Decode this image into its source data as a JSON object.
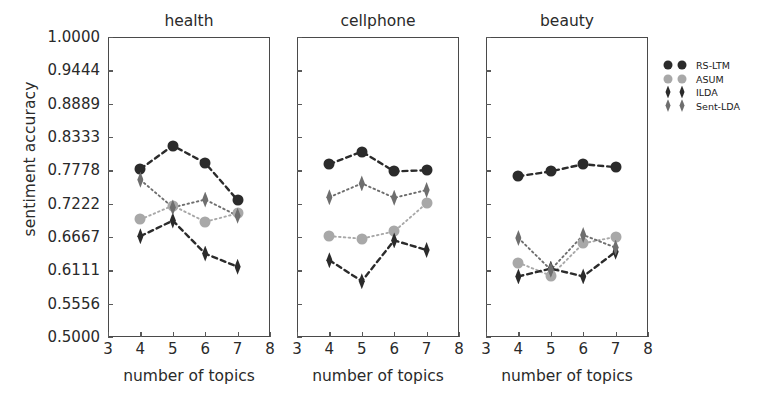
{
  "figure": {
    "ylabel": "sentiment accuracy",
    "xlabel": "number of topics",
    "yticks": [
      "1.0000",
      "0.9444",
      "0.8889",
      "0.8333",
      "0.7778",
      "0.7222",
      "0.6667",
      "0.6111",
      "0.5556",
      "0.5000"
    ],
    "ytickvals": [
      1.0,
      0.9444,
      0.8889,
      0.8333,
      0.7778,
      0.7222,
      0.6667,
      0.6111,
      0.5556,
      0.5
    ],
    "xticks": [
      "3",
      "4",
      "5",
      "6",
      "7",
      "8"
    ],
    "xtickvals": [
      3,
      4,
      5,
      6,
      7,
      8
    ]
  },
  "colors": {
    "dark": "#2b2b2b",
    "light": "#a8a8a8",
    "medium": "#6e6e6e",
    "axis": "#4a4a4a",
    "text": "#2a2a2a"
  },
  "legend": {
    "entries": [
      {
        "label": "RS-LTM",
        "marker": "circle",
        "shade": "dark",
        "linestyle": "dashed"
      },
      {
        "label": "ASUM",
        "marker": "circle",
        "shade": "light",
        "linestyle": "dotted"
      },
      {
        "label": "ILDA",
        "marker": "diamond",
        "shade": "dark",
        "linestyle": "dashed"
      },
      {
        "label": "Sent-LDA",
        "marker": "diamond",
        "shade": "medium",
        "linestyle": "dotted"
      }
    ]
  },
  "chart_data": {
    "type": "line",
    "title": "",
    "xlabel": "number of topics",
    "ylabel": "sentiment accuracy",
    "xlim": [
      3,
      8
    ],
    "ylim": [
      0.5,
      1.0
    ],
    "grid": false,
    "legend_position": "right",
    "x": [
      4,
      5,
      6,
      7
    ],
    "panels": [
      {
        "title": "health",
        "series": [
          {
            "name": "RS-LTM",
            "values": [
              0.78,
              0.819,
              0.79,
              0.728
            ]
          },
          {
            "name": "ASUM",
            "values": [
              0.696,
              0.719,
              0.692,
              0.706
            ]
          },
          {
            "name": "ILDA",
            "values": [
              0.668,
              0.694,
              0.639,
              0.617
            ]
          },
          {
            "name": "Sent-LDA",
            "values": [
              0.762,
              0.716,
              0.729,
              0.702
            ]
          }
        ]
      },
      {
        "title": "cellphone",
        "series": [
          {
            "name": "RS-LTM",
            "values": [
              0.788,
              0.809,
              0.776,
              0.778
            ]
          },
          {
            "name": "ASUM",
            "values": [
              0.668,
              0.664,
              0.676,
              0.723
            ]
          },
          {
            "name": "ILDA",
            "values": [
              0.628,
              0.593,
              0.661,
              0.645
            ]
          },
          {
            "name": "Sent-LDA",
            "values": [
              0.733,
              0.756,
              0.732,
              0.745
            ]
          }
        ]
      },
      {
        "title": "beauty",
        "series": [
          {
            "name": "RS-LTM",
            "values": [
              0.768,
              0.776,
              0.788,
              0.783
            ]
          },
          {
            "name": "ASUM",
            "values": [
              0.624,
              0.602,
              0.656,
              0.667
            ]
          },
          {
            "name": "ILDA",
            "values": [
              0.601,
              0.614,
              0.601,
              0.642
            ]
          },
          {
            "name": "Sent-LDA",
            "values": [
              0.665,
              0.612,
              0.67,
              0.649
            ]
          }
        ]
      }
    ]
  }
}
